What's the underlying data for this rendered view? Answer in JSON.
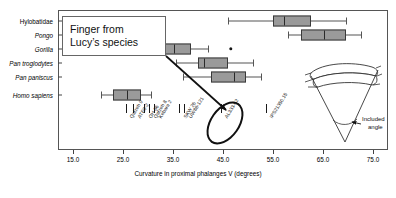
{
  "chart_data": {
    "type": "box",
    "title": "",
    "xlabel": "Curvature in proximal phalanges V (degrees)",
    "ylabel": "",
    "xlim": [
      12.0,
      78.0
    ],
    "xticks": [
      "15.0",
      "25.0",
      "35.0",
      "45.0",
      "55.0",
      "65.0",
      "75.0"
    ],
    "xtick_values": [
      15.0,
      25.0,
      35.0,
      45.0,
      55.0,
      65.0,
      75.0
    ],
    "grid": false,
    "legend": "none",
    "categories": [
      "Hylobatidae",
      "Pongo",
      "Gorilla",
      "Pan troglodytes",
      "Pan paniscus",
      "Homo sapiens"
    ],
    "boxes": [
      {
        "name": "Hylobatidae",
        "whisker_low": 46.0,
        "q1": 55.0,
        "median": 57.0,
        "q3": 62.5,
        "whisker_high": 69.5,
        "outliers": []
      },
      {
        "name": "Pongo",
        "whisker_low": 58.0,
        "q1": 60.5,
        "median": 65.0,
        "q3": 69.5,
        "whisker_high": 72.5,
        "outliers": []
      },
      {
        "name": "Gorilla",
        "whisker_low": 29.0,
        "q1": 33.0,
        "median": 35.0,
        "q3": 38.5,
        "whisker_high": 42.0,
        "outliers": [
          46.5
        ]
      },
      {
        "name": "Pan troglodytes",
        "whisker_low": 35.5,
        "q1": 40.0,
        "median": 41.0,
        "q3": 46.0,
        "whisker_high": 51.0,
        "outliers": []
      },
      {
        "name": "Pan paniscus",
        "whisker_low": 37.0,
        "q1": 42.5,
        "median": 47.0,
        "q3": 49.5,
        "whisker_high": 52.5,
        "outliers": []
      },
      {
        "name": "Homo sapiens",
        "whisker_low": 20.5,
        "q1": 23.0,
        "median": 25.5,
        "q3": 28.5,
        "whisker_high": 30.5,
        "outliers": []
      }
    ],
    "specimens": [
      {
        "label": "Qafzeh 9",
        "value": 25.5,
        "highlighted": false
      },
      {
        "label": "ATE9-2",
        "value": 27.0,
        "highlighted": false
      },
      {
        "label": "OH 86",
        "value": 29.2,
        "highlighted": false
      },
      {
        "label": "Qafzeh 8",
        "value": 30.2,
        "highlighted": false
      },
      {
        "label": "Kebara 2",
        "value": 31.2,
        "highlighted": false
      },
      {
        "label": "SKW 26",
        "value": 36.2,
        "highlighted": false
      },
      {
        "label": "UW88-121",
        "value": 37.2,
        "highlighted": false
      },
      {
        "label": "AL333-62",
        "value": 44.5,
        "highlighted": true
      },
      {
        "label": "IPS21350.15",
        "value": 53.5,
        "highlighted": false
      }
    ]
  },
  "callout": {
    "line1": "Finger from",
    "line2": "Lucy’s species",
    "points_to": "AL333-62"
  },
  "inset": {
    "caption_line1": "Included",
    "caption_line2": "angle"
  },
  "colors": {
    "box_fill": "#9a9a9a",
    "box_edge": "#3a3a3a",
    "whisker": "#555555",
    "highlight": "#111111",
    "frame": "#555555"
  }
}
